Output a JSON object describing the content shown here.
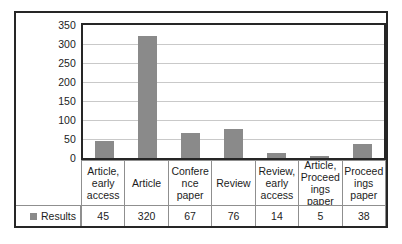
{
  "chart_data": {
    "type": "bar",
    "title": "",
    "subtitle": "",
    "xlabel": "",
    "ylabel": "",
    "categories": [
      "Article, early access",
      "Article",
      "Confere nce paper",
      "Review",
      "Review, early access",
      "Article, Proceed ings paper",
      "Proceed ings paper"
    ],
    "values": [
      45,
      320,
      67,
      76,
      14,
      5,
      38
    ],
    "series": [
      {
        "name": "Results",
        "values": [
          45,
          320,
          67,
          76,
          14,
          5,
          38
        ]
      }
    ],
    "ylim": [
      0,
      350
    ],
    "yticks": [
      0,
      50,
      100,
      150,
      200,
      250,
      300,
      350
    ],
    "ytick_labels": [
      "0",
      "50",
      "100",
      "150",
      "200",
      "250",
      "300",
      "350"
    ],
    "grid": true,
    "legend_position": "bottom-left-table",
    "bar_color": "#8a8a8a",
    "gridline_color": "#c9c9c9",
    "axis_color": "#262626",
    "table_line_color": "#8f8f8f"
  },
  "legend": {
    "marker_name": "legend-color-swatch",
    "label": "Results"
  },
  "value_row": {
    "cells": [
      "45",
      "320",
      "67",
      "76",
      "14",
      "5",
      "38"
    ]
  }
}
